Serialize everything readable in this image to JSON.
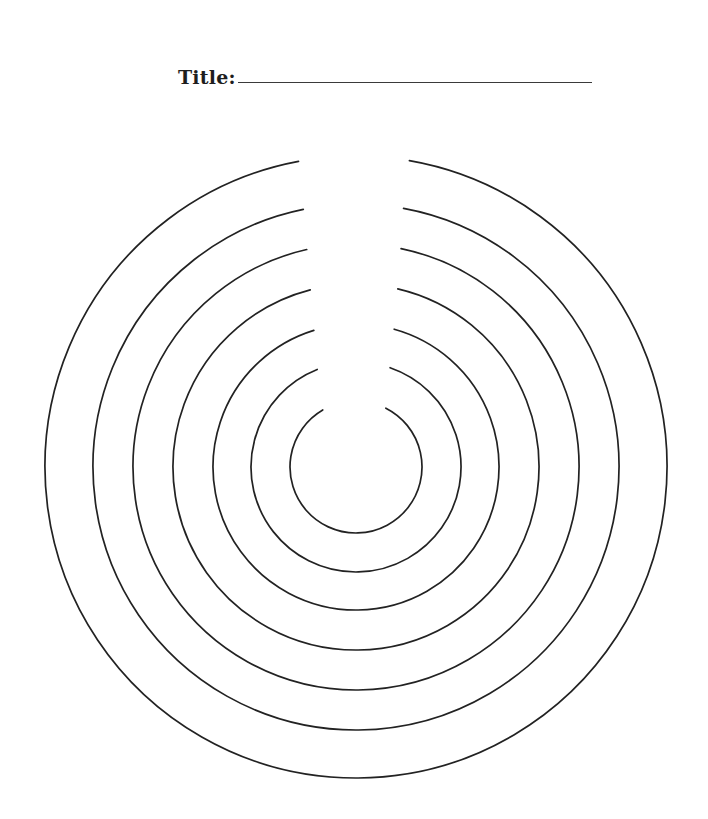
{
  "worksheet": {
    "title_label": "Title:",
    "title_value": ""
  },
  "colors": {
    "ink": "#222222",
    "background": "#ffffff"
  },
  "rings": {
    "center": [
      356,
      467
    ],
    "count": 7,
    "radii": [
      311,
      263,
      223,
      183,
      143,
      105,
      66
    ],
    "gap_endpoints": [
      {
        "left": [
          299,
          164
        ],
        "right": [
          409,
          163
        ]
      },
      {
        "left": [
          303,
          208
        ],
        "right": [
          404,
          206
        ]
      },
      {
        "left": [
          307,
          251
        ],
        "right": [
          401,
          249
        ]
      },
      {
        "left": [
          310,
          289
        ],
        "right": [
          398,
          288
        ]
      },
      {
        "left": [
          314,
          331
        ],
        "right": [
          394,
          330
        ]
      },
      {
        "left": [
          317,
          369
        ],
        "right": [
          390,
          368
        ]
      },
      {
        "left": [
          321,
          407
        ],
        "right": [
          387,
          406
        ]
      }
    ]
  }
}
